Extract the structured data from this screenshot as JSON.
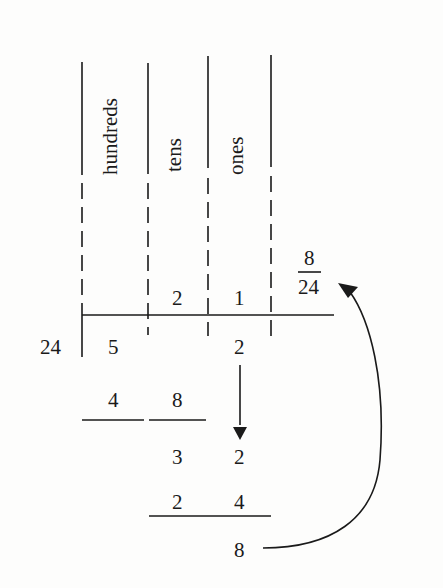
{
  "diagram": {
    "columns": [
      {
        "label": "hundreds",
        "quotient_digit": "",
        "dividend_digit": "5"
      },
      {
        "label": "tens",
        "quotient_digit": "2",
        "dividend_digit": ""
      },
      {
        "label": "ones",
        "quotient_digit": "1",
        "dividend_digit": "2"
      }
    ],
    "divisor": "24",
    "remainder_fraction": {
      "numerator": "8",
      "denominator": "24"
    },
    "steps": [
      {
        "row": "subtract_1",
        "digits": [
          "4",
          "8"
        ]
      },
      {
        "row": "partial_1",
        "digits": [
          "3",
          "2"
        ]
      },
      {
        "row": "subtract_2",
        "digits": [
          "2",
          "4"
        ]
      },
      {
        "row": "remainder",
        "digits": [
          "8"
        ]
      }
    ],
    "arrows": [
      {
        "name": "bring-down-arrow",
        "description": "ones digit 2 brought down"
      },
      {
        "name": "remainder-arrow",
        "description": "remainder 8 carried up to fraction 8/24"
      }
    ],
    "colors": {
      "ink": "#1a1a1a",
      "paper": "#fdfdfc"
    }
  }
}
